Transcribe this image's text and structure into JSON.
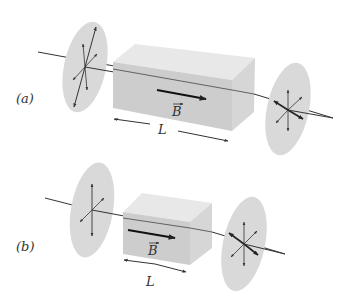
{
  "figure": {
    "panels": [
      {
        "id": "a",
        "label": "(a)",
        "field_label": "B",
        "length_label": "L",
        "description": "Long Faraday-rotator block of length L with magnetic field B along beam between two polarizer disks"
      },
      {
        "id": "b",
        "label": "(b)",
        "field_label": "B",
        "length_label": "L",
        "description": "Short Faraday-rotator block of length L with magnetic field B along beam between two polarizer disks"
      }
    ],
    "colors": {
      "disk_fill": "#d9d9d9",
      "box_front": "#cfcfcf",
      "box_top": "#e6e6e6",
      "box_side": "#dcdcdc",
      "line": "#333333"
    }
  }
}
